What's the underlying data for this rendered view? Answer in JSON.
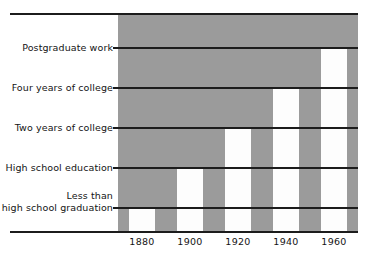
{
  "chart_data": {
    "type": "bar",
    "title": "",
    "subtitle": "",
    "xlabel": "",
    "ylabel": "",
    "categories": [
      "1880",
      "1900",
      "1920",
      "1940",
      "1960"
    ],
    "values": [
      1,
      2,
      3,
      4,
      5
    ],
    "value_labels": [
      "Less than high school graduation",
      "High school education",
      "Two years of college",
      "Four years of college",
      "Postgraduate work"
    ],
    "ylim": [
      0,
      5.4
    ],
    "ytick_labels": [
      "Less than\nhigh school graduation",
      "High school education",
      "Two years of college",
      "Four years of college",
      "Postgraduate work"
    ],
    "ytick_values": [
      1,
      2,
      3,
      4,
      5
    ],
    "xtick_labels": [
      "1880",
      "1900",
      "1920",
      "1940",
      "1960"
    ],
    "grid": true,
    "grid_axis": "y",
    "legend": false,
    "legend_position": "none",
    "series": [
      {
        "name": "Educational attainment",
        "values": [
          1,
          2,
          3,
          4,
          5
        ],
        "point_labels": [
          "Less than high school graduation",
          "High school education",
          "Two years of college",
          "Four years of college",
          "Postgraduate work"
        ]
      }
    ],
    "colors": {
      "bar_fill": "#fdfdfd",
      "panel_background": "#9b9b9b",
      "gridline": "#1c1c1c",
      "axis_rule": "#1c1c1c",
      "text": "#141414",
      "page_background": "#ffffff"
    }
  },
  "axis": {
    "y_categories": [
      {
        "id": "less-than-high-school",
        "label": "Less than\nhigh school graduation",
        "level": 1
      },
      {
        "id": "high-school-education",
        "label": "High school education",
        "level": 2
      },
      {
        "id": "two-years-of-college",
        "label": "Two years of college",
        "level": 3
      },
      {
        "id": "four-years-of-college",
        "label": "Four years of college",
        "level": 4
      },
      {
        "id": "postgraduate-work",
        "label": "Postgraduate work",
        "level": 5
      }
    ],
    "x_ticks": [
      {
        "id": "1880",
        "label": "1880"
      },
      {
        "id": "1900",
        "label": "1900"
      },
      {
        "id": "1920",
        "label": "1920"
      },
      {
        "id": "1940",
        "label": "1940"
      },
      {
        "id": "1960",
        "label": "1960"
      }
    ]
  },
  "bars": [
    {
      "id": "bar-1880",
      "year": "1880",
      "level": 1,
      "attainment": "Less than high school graduation"
    },
    {
      "id": "bar-1900",
      "year": "1900",
      "level": 2,
      "attainment": "High school education"
    },
    {
      "id": "bar-1920",
      "year": "1920",
      "level": 3,
      "attainment": "Two years of college"
    },
    {
      "id": "bar-1940",
      "year": "1940",
      "level": 4,
      "attainment": "Four years of college"
    },
    {
      "id": "bar-1960",
      "year": "1960",
      "level": 5,
      "attainment": "Postgraduate work"
    }
  ]
}
